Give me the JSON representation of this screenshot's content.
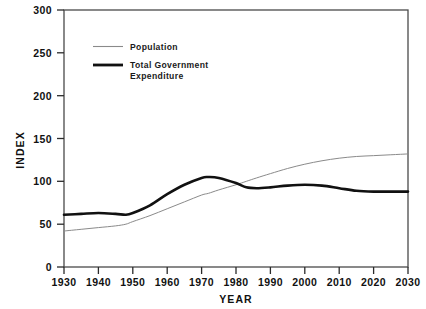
{
  "chart_data": {
    "type": "line",
    "title": "",
    "xlabel": "YEAR",
    "ylabel": "INDEX",
    "xlim": [
      1930,
      2030
    ],
    "ylim": [
      0,
      300
    ],
    "grid": false,
    "legend_position": "top-left-inside",
    "xticks": [
      1930,
      1940,
      1950,
      1960,
      1970,
      1980,
      1990,
      2000,
      2010,
      2020,
      2030
    ],
    "xtick_labels": [
      "1930",
      "1940",
      "1950",
      "1960",
      "1970",
      "1980",
      "1990",
      "2000",
      "2010",
      "2020",
      "2030"
    ],
    "yticks": [
      0,
      50,
      100,
      150,
      200,
      250,
      300
    ],
    "ytick_labels": [
      "0",
      "50",
      "100",
      "150",
      "200",
      "250",
      "300"
    ],
    "x": [
      1930,
      1935,
      1940,
      1945,
      1948,
      1950,
      1955,
      1960,
      1965,
      1970,
      1972,
      1975,
      1980,
      1983,
      1986,
      1990,
      1995,
      2000,
      2005,
      2010,
      2015,
      2020,
      2025,
      2030
    ],
    "series": [
      {
        "name": "Population",
        "color": "#8a8a8a",
        "width": 1.0,
        "values": [
          42,
          44,
          46,
          48,
          50,
          53,
          60,
          68,
          76,
          84,
          86,
          90,
          96,
          100,
          104,
          109,
          115,
          120,
          124,
          127,
          129,
          130,
          131,
          132
        ]
      },
      {
        "name": "Total Government Expenditure",
        "color": "#111111",
        "width": 2.6,
        "values": [
          61,
          62,
          63,
          62,
          61,
          63,
          72,
          85,
          96,
          104,
          105,
          104,
          98,
          93,
          92,
          93,
          95,
          96,
          95,
          92,
          89,
          88,
          88,
          88
        ]
      }
    ]
  },
  "legend": {
    "items": [
      {
        "label": "Population",
        "line": "thin-gray-line"
      },
      {
        "label": "Total Government",
        "label2": "Expenditure",
        "line": "thick-black-line"
      }
    ]
  },
  "axis": {
    "y_title": "INDEX",
    "x_title": "YEAR"
  }
}
